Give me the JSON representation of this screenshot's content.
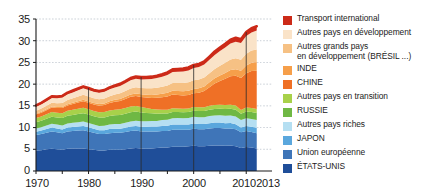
{
  "chart_data": {
    "type": "area",
    "stacked": true,
    "title": "",
    "subtitle": "",
    "xlabel": "",
    "ylabel": "",
    "xlim": [
      1970,
      2013
    ],
    "ylim": [
      0,
      35
    ],
    "yticks": [
      0,
      5,
      10,
      15,
      20,
      25,
      30,
      35
    ],
    "xticks": [
      1970,
      1980,
      1990,
      2000,
      2010,
      2013
    ],
    "xtick_labels": [
      "1970",
      "1980",
      "1990",
      "2000",
      "2010",
      "2013"
    ],
    "grid": true,
    "grid_axis": "y",
    "legend_position": "right",
    "x": [
      1970,
      1971,
      1972,
      1973,
      1974,
      1975,
      1976,
      1977,
      1978,
      1979,
      1980,
      1981,
      1982,
      1983,
      1984,
      1985,
      1986,
      1987,
      1988,
      1989,
      1990,
      1991,
      1992,
      1993,
      1994,
      1995,
      1996,
      1997,
      1998,
      1999,
      2000,
      2001,
      2002,
      2003,
      2004,
      2005,
      2006,
      2007,
      2008,
      2009,
      2010,
      2011,
      2012
    ],
    "series": [
      {
        "name": "ÉTATS-UNIS",
        "color": "#1f4e99",
        "values": [
          4.7,
          4.8,
          5.0,
          5.1,
          5.0,
          4.9,
          5.1,
          5.2,
          5.2,
          5.2,
          5.0,
          4.9,
          4.7,
          4.7,
          4.9,
          4.9,
          4.9,
          5.0,
          5.2,
          5.3,
          5.2,
          5.1,
          5.2,
          5.3,
          5.4,
          5.4,
          5.6,
          5.6,
          5.6,
          5.7,
          5.8,
          5.7,
          5.7,
          5.8,
          5.9,
          5.9,
          5.8,
          5.9,
          5.7,
          5.3,
          5.5,
          5.4,
          5.2
        ]
      },
      {
        "name": "Union européenne",
        "color": "#3f75b8",
        "values": [
          3.6,
          3.7,
          3.8,
          4.0,
          3.9,
          3.8,
          4.0,
          4.0,
          4.1,
          4.2,
          4.1,
          3.9,
          3.8,
          3.8,
          3.8,
          3.9,
          3.9,
          4.0,
          4.0,
          4.0,
          3.9,
          4.0,
          3.9,
          3.8,
          3.8,
          3.8,
          3.9,
          3.9,
          3.9,
          3.8,
          3.9,
          3.9,
          3.9,
          4.0,
          4.0,
          4.0,
          4.0,
          3.9,
          3.9,
          3.6,
          3.7,
          3.6,
          3.5
        ]
      },
      {
        "name": "JAPON",
        "color": "#5aa7dd",
        "values": [
          0.75,
          0.8,
          0.86,
          0.92,
          0.9,
          0.88,
          0.92,
          0.94,
          0.94,
          0.98,
          0.95,
          0.92,
          0.9,
          0.9,
          0.95,
          0.95,
          0.95,
          0.97,
          1.02,
          1.05,
          1.08,
          1.1,
          1.12,
          1.12,
          1.18,
          1.2,
          1.22,
          1.22,
          1.18,
          1.2,
          1.22,
          1.2,
          1.22,
          1.22,
          1.24,
          1.24,
          1.22,
          1.24,
          1.18,
          1.1,
          1.16,
          1.2,
          1.25
        ]
      },
      {
        "name": "Autres pays riches",
        "color": "#b5dff2",
        "values": [
          0.75,
          0.78,
          0.82,
          0.88,
          0.88,
          0.88,
          0.92,
          0.95,
          0.98,
          1.02,
          1.02,
          1.0,
          0.98,
          1.0,
          1.05,
          1.08,
          1.1,
          1.14,
          1.2,
          1.24,
          1.26,
          1.28,
          1.3,
          1.32,
          1.36,
          1.4,
          1.44,
          1.46,
          1.48,
          1.5,
          1.55,
          1.56,
          1.58,
          1.62,
          1.66,
          1.7,
          1.72,
          1.76,
          1.78,
          1.72,
          1.8,
          1.8,
          1.82
        ]
      },
      {
        "name": "RUSSIE",
        "color": "#6fb844",
        "values": [
          1.45,
          1.5,
          1.56,
          1.62,
          1.66,
          1.72,
          1.78,
          1.82,
          1.88,
          1.92,
          1.92,
          1.9,
          1.92,
          1.94,
          1.98,
          2.0,
          2.04,
          2.08,
          2.12,
          2.1,
          2.05,
          1.9,
          1.75,
          1.65,
          1.5,
          1.45,
          1.45,
          1.4,
          1.38,
          1.38,
          1.42,
          1.44,
          1.44,
          1.48,
          1.48,
          1.5,
          1.54,
          1.54,
          1.56,
          1.46,
          1.54,
          1.58,
          1.56
        ]
      },
      {
        "name": "Autres pays en transition",
        "color": "#a8d14a",
        "values": [
          0.95,
          0.98,
          1.02,
          1.06,
          1.08,
          1.12,
          1.16,
          1.18,
          1.22,
          1.26,
          1.24,
          1.22,
          1.22,
          1.24,
          1.26,
          1.28,
          1.3,
          1.32,
          1.32,
          1.28,
          1.22,
          1.12,
          1.02,
          0.95,
          0.88,
          0.86,
          0.86,
          0.84,
          0.82,
          0.82,
          0.84,
          0.86,
          0.86,
          0.88,
          0.9,
          0.9,
          0.92,
          0.92,
          0.94,
          0.88,
          0.92,
          0.94,
          0.94
        ]
      },
      {
        "name": "CHINE",
        "color": "#ef7026",
        "values": [
          0.8,
          0.88,
          0.95,
          1.02,
          1.06,
          1.18,
          1.2,
          1.32,
          1.45,
          1.5,
          1.48,
          1.46,
          1.52,
          1.6,
          1.72,
          1.85,
          1.95,
          2.08,
          2.22,
          2.3,
          2.32,
          2.42,
          2.52,
          2.72,
          2.88,
          3.05,
          3.15,
          3.1,
          3.05,
          3.1,
          3.15,
          3.35,
          3.7,
          4.3,
          4.95,
          5.5,
          6.05,
          6.55,
          6.85,
          7.35,
          7.9,
          8.5,
          8.8
        ]
      },
      {
        "name": "INDE",
        "color": "#f69f4a",
        "values": [
          0.2,
          0.21,
          0.22,
          0.23,
          0.24,
          0.26,
          0.27,
          0.29,
          0.3,
          0.31,
          0.32,
          0.34,
          0.36,
          0.38,
          0.4,
          0.43,
          0.46,
          0.5,
          0.54,
          0.58,
          0.62,
          0.66,
          0.7,
          0.73,
          0.77,
          0.83,
          0.88,
          0.92,
          0.96,
          1.0,
          1.02,
          1.05,
          1.08,
          1.12,
          1.2,
          1.26,
          1.34,
          1.44,
          1.54,
          1.66,
          1.78,
          1.88,
          2.0
        ]
      },
      {
        "name": "Autres grands pays en développement (BRÉSIL ...)",
        "color": "#f6c184",
        "values": [
          0.7,
          0.74,
          0.8,
          0.86,
          0.9,
          0.94,
          1.0,
          1.04,
          1.08,
          1.14,
          1.14,
          1.12,
          1.12,
          1.14,
          1.18,
          1.22,
          1.28,
          1.32,
          1.38,
          1.42,
          1.44,
          1.48,
          1.52,
          1.58,
          1.64,
          1.7,
          1.78,
          1.84,
          1.88,
          1.92,
          1.98,
          2.0,
          2.04,
          2.1,
          2.18,
          2.26,
          2.34,
          2.44,
          2.54,
          2.56,
          2.72,
          2.82,
          2.92
        ]
      },
      {
        "name": "Autres pays en développement",
        "color": "#fae3c8",
        "values": [
          0.9,
          0.96,
          1.04,
          1.12,
          1.16,
          1.22,
          1.3,
          1.36,
          1.42,
          1.5,
          1.5,
          1.48,
          1.48,
          1.52,
          1.58,
          1.64,
          1.72,
          1.8,
          1.88,
          1.96,
          2.0,
          2.06,
          2.14,
          2.22,
          2.3,
          2.4,
          2.5,
          2.58,
          2.66,
          2.74,
          2.84,
          2.9,
          2.98,
          3.08,
          3.22,
          3.36,
          3.5,
          3.64,
          3.78,
          3.82,
          4.04,
          4.2,
          4.36
        ]
      },
      {
        "name": "Transport international",
        "color": "#cc2a18",
        "values": [
          0.32,
          0.34,
          0.36,
          0.38,
          0.38,
          0.38,
          0.4,
          0.42,
          0.43,
          0.45,
          0.44,
          0.43,
          0.42,
          0.42,
          0.44,
          0.45,
          0.47,
          0.49,
          0.51,
          0.53,
          0.54,
          0.54,
          0.55,
          0.56,
          0.58,
          0.6,
          0.62,
          0.64,
          0.66,
          0.68,
          0.7,
          0.7,
          0.71,
          0.74,
          0.78,
          0.81,
          0.85,
          0.88,
          0.9,
          0.86,
          0.92,
          0.95,
          0.97
        ]
      }
    ],
    "totals_note": "",
    "decade_markers": [
      1980,
      1990,
      2000,
      2010
    ]
  },
  "legend": {
    "entries": [
      {
        "label": "Transport international",
        "color": "#cc2a18"
      },
      {
        "label": "Autres pays en développement",
        "color": "#fae3c8"
      },
      {
        "label": "Autres grands pays\nen développement (BRÉSIL ...)",
        "color": "#f6c184"
      },
      {
        "label": "INDE",
        "color": "#f69f4a"
      },
      {
        "label": "CHINE",
        "color": "#ef7026"
      },
      {
        "label": "Autres pays en transition",
        "color": "#a8d14a"
      },
      {
        "label": "RUSSIE",
        "color": "#6fb844"
      },
      {
        "label": "Autres pays riches",
        "color": "#b5dff2"
      },
      {
        "label": "JAPON",
        "color": "#5aa7dd"
      },
      {
        "label": "Union européenne",
        "color": "#3f75b8"
      },
      {
        "label": "ÉTATS-UNIS",
        "color": "#1f4e99"
      }
    ]
  },
  "axes": {
    "y_labels": [
      "35",
      "30",
      "25",
      "20",
      "15",
      "10",
      "5",
      "0"
    ],
    "x_labels": [
      "1970",
      "1980",
      "1990",
      "2000",
      "2010",
      "2013"
    ]
  },
  "colors": {
    "axis": "#1b1b1b",
    "grid": "#9aa6b4",
    "background": "#ffffff"
  }
}
